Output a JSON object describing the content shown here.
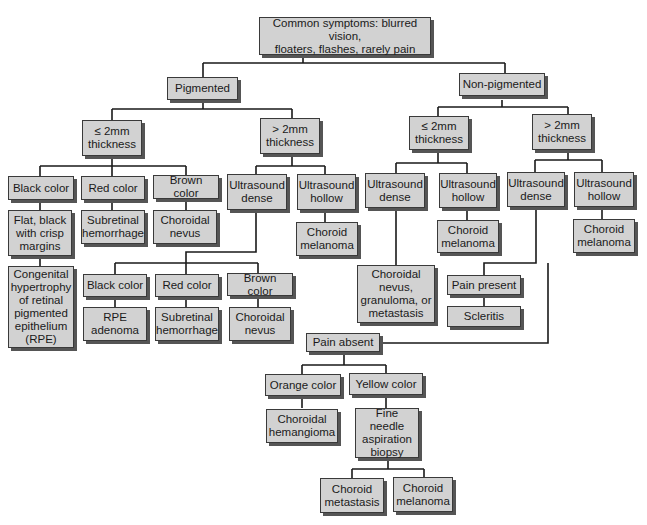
{
  "diagram": {
    "type": "flowchart",
    "root": {
      "label": "Common symptoms: blurred vision,\nfloaters, flashes, rarely pain"
    },
    "nodes": {
      "pigmented": "Pigmented",
      "non_pigmented": "Non-pigmented",
      "p_le2": "≤ 2mm\nthickness",
      "p_gt2": "> 2mm\nthickness",
      "np_le2": "≤ 2mm\nthickness",
      "np_gt2": "> 2mm\nthickness",
      "p_le2_black": "Black color",
      "p_le2_red": "Red color",
      "p_le2_brown": "Brown color",
      "p_le2_black_result": "Flat, black\nwith crisp\nmargins",
      "p_le2_black_result2": "Congenital\nhypertrophy\nof retinal\npigmented\nepithelium\n(RPE)",
      "p_le2_red_result": "Subretinal\nhemorrhage",
      "p_le2_brown_result": "Choroidal\nnevus",
      "p_gt2_dense": "Ultrasound\ndense",
      "p_gt2_hollow": "Ultrasound\nhollow",
      "p_gt2_hollow_result": "Choroid\nmelanoma",
      "p_gt2_dense_black": "Black color",
      "p_gt2_dense_red": "Red color",
      "p_gt2_dense_brown": "Brown color",
      "p_gt2_dense_black_result": "RPE\nadenoma",
      "p_gt2_dense_red_result": "Subretinal\nhemorrhage",
      "p_gt2_dense_brown_result": "Choroidal\nnevus",
      "np_le2_dense": "Ultrasound\ndense",
      "np_le2_hollow": "Ultrasound\nhollow",
      "np_le2_dense_result": "Choroidal\nnevus,\ngranuloma, or\nmetastasis",
      "np_le2_hollow_result": "Choroid\nmelanoma",
      "np_gt2_dense": "Ultrasound\ndense",
      "np_gt2_hollow": "Ultrasound\nhollow",
      "np_gt2_hollow_result": "Choroid\nmelanoma",
      "pain_present": "Pain present",
      "pain_present_result": "Scleritis",
      "pain_absent": "Pain absent",
      "orange": "Orange color",
      "yellow": "Yellow color",
      "orange_result": "Choroidal\nhemangioma",
      "yellow_result": "Fine needle\naspiration\nbiopsy",
      "biopsy_metastasis": "Choroid\nmetastasis",
      "biopsy_melanoma": "Choroid\nmelanoma"
    },
    "colors": {
      "box_fill": "#d2d2d2",
      "box_border": "#3a3a3a",
      "shadow": "#555555",
      "line": "#1a1a1a"
    }
  }
}
